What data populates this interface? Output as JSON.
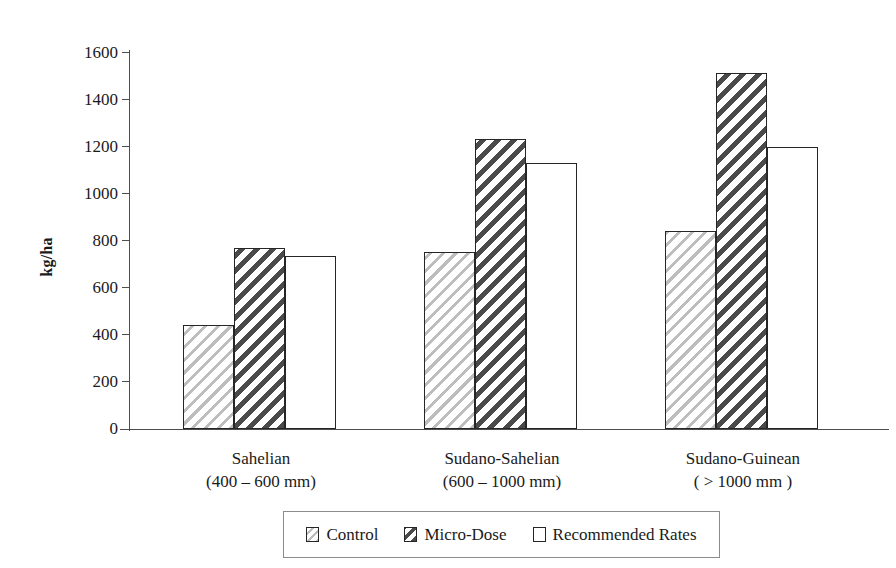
{
  "chart_data": {
    "type": "bar",
    "title": "",
    "xlabel": "",
    "ylabel": "kg/ha",
    "ylim": [
      0,
      1600
    ],
    "ytick_step": 200,
    "yticks": [
      1600,
      1400,
      1200,
      1000,
      800,
      600,
      400,
      200,
      0
    ],
    "ytick_labels": [
      "1600",
      "1400",
      "1200",
      "1000",
      "800",
      "600",
      "400",
      "200",
      "0"
    ],
    "grid": false,
    "legend_position": "bottom",
    "categories": [
      "Sahelian",
      "Sudano-Sahelian",
      "Sudano-Guinean"
    ],
    "category_sublabels": [
      "(400 – 600 mm)",
      "(600 – 1000 mm)",
      "( > 1000 mm )"
    ],
    "series": [
      {
        "name": "Control",
        "values": [
          440,
          750,
          840
        ],
        "pattern": "light-diagonal-hatch",
        "color": "#bdbdbd"
      },
      {
        "name": "Micro-Dose",
        "values": [
          770,
          1230,
          1510
        ],
        "pattern": "dark-diagonal-hatch",
        "color": "#4a4a4a"
      },
      {
        "name": "Recommended Rates",
        "values": [
          735,
          1130,
          1195
        ],
        "pattern": "solid-white",
        "color": "#ffffff"
      }
    ]
  },
  "legend": {
    "items": [
      {
        "label": "Control"
      },
      {
        "label": "Micro-Dose"
      },
      {
        "label": "Recommended Rates"
      }
    ]
  },
  "axis": {
    "y_title": "kg/ha"
  }
}
